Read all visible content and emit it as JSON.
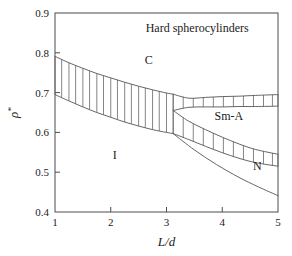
{
  "figure": {
    "title": "Hard spherocylinders"
  },
  "chart_data": {
    "type": "line",
    "title": "Hard spherocylinders",
    "xlabel": "L/d",
    "ylabel": "ρ*",
    "xlim": [
      1,
      5
    ],
    "ylim": [
      0.4,
      0.9
    ],
    "xticks": [
      1,
      2,
      3,
      4,
      5
    ],
    "xtick_labels": [
      "1",
      "2",
      "3",
      "4",
      "5"
    ],
    "yticks": [
      0.4,
      0.5,
      0.6,
      0.7,
      0.8,
      0.9
    ],
    "ytick_labels": [
      "0.4",
      "0.5",
      "0.6",
      "0.7",
      "0.8",
      "0.9"
    ],
    "grid": false,
    "legend": "none",
    "annotations": [
      {
        "text": "Hard spherocylinders",
        "x": 3.55,
        "y": 0.853,
        "name": "chart-title-annotation"
      },
      {
        "text": "C",
        "x": 2.68,
        "y": 0.772,
        "name": "phase-label-c"
      },
      {
        "text": "I",
        "x": 2.07,
        "y": 0.534,
        "name": "phase-label-i"
      },
      {
        "text": "Sm-A",
        "x": 4.12,
        "y": 0.632,
        "name": "phase-label-sm-a"
      },
      {
        "text": "N",
        "x": 4.63,
        "y": 0.506,
        "name": "phase-label-n"
      }
    ],
    "triple_point": {
      "x": 3.12,
      "y": 0.655
    },
    "series": [
      {
        "name": "I-C upper boundary",
        "x": [
          1.0,
          1.25,
          1.5,
          1.75,
          2.0,
          2.25,
          2.5,
          2.75,
          3.0,
          3.12
        ],
        "values": [
          0.791,
          0.775,
          0.761,
          0.748,
          0.737,
          0.726,
          0.716,
          0.707,
          0.699,
          0.696
        ]
      },
      {
        "name": "I-C lower boundary",
        "x": [
          1.0,
          1.25,
          1.5,
          1.75,
          2.0,
          2.25,
          2.5,
          2.75,
          3.0,
          3.12
        ],
        "values": [
          0.695,
          0.679,
          0.664,
          0.65,
          0.638,
          0.626,
          0.616,
          0.607,
          0.6,
          0.597
        ]
      },
      {
        "name": "C-SmA upper boundary",
        "x": [
          3.12,
          3.4,
          3.7,
          4.0,
          4.3,
          4.6,
          5.0
        ],
        "values": [
          0.696,
          0.686,
          0.688,
          0.69,
          0.691,
          0.693,
          0.695
        ]
      },
      {
        "name": "C-SmA lower boundary",
        "x": [
          3.12,
          3.4,
          3.7,
          4.0,
          4.3,
          4.6,
          5.0
        ],
        "values": [
          0.655,
          0.663,
          0.664,
          0.664,
          0.665,
          0.665,
          0.666
        ]
      },
      {
        "name": "SmA-N upper boundary",
        "x": [
          3.12,
          3.4,
          3.7,
          4.0,
          4.3,
          4.6,
          5.0
        ],
        "values": [
          0.655,
          0.628,
          0.607,
          0.588,
          0.571,
          0.557,
          0.545
        ]
      },
      {
        "name": "SmA-N lower boundary",
        "x": [
          3.12,
          3.4,
          3.7,
          4.0,
          4.3,
          4.6,
          5.0
        ],
        "values": [
          0.597,
          0.582,
          0.565,
          0.549,
          0.535,
          0.524,
          0.515
        ]
      },
      {
        "name": "I-N lower boundary",
        "x": [
          3.12,
          3.5,
          3.9,
          4.3,
          4.65,
          5.0
        ],
        "values": [
          0.597,
          0.556,
          0.519,
          0.487,
          0.463,
          0.441
        ]
      }
    ],
    "tie_lines": [
      {
        "band": "I-C",
        "x_positions": [
          1.0,
          1.12,
          1.25,
          1.37,
          1.5,
          1.62,
          1.75,
          1.87,
          2.0,
          2.12,
          2.25,
          2.37,
          2.5,
          2.62,
          2.75,
          2.87,
          3.0,
          3.12
        ]
      },
      {
        "band": "C-SmA",
        "x_positions": [
          3.12,
          3.3,
          3.48,
          3.66,
          3.84,
          4.02,
          4.2,
          4.38,
          4.56,
          4.74,
          4.9,
          5.0
        ]
      },
      {
        "band": "SmA-N",
        "x_positions": [
          3.12,
          3.3,
          3.48,
          3.66,
          3.84,
          4.02,
          4.2,
          4.38,
          4.56,
          4.74,
          4.9,
          5.0
        ]
      }
    ]
  }
}
